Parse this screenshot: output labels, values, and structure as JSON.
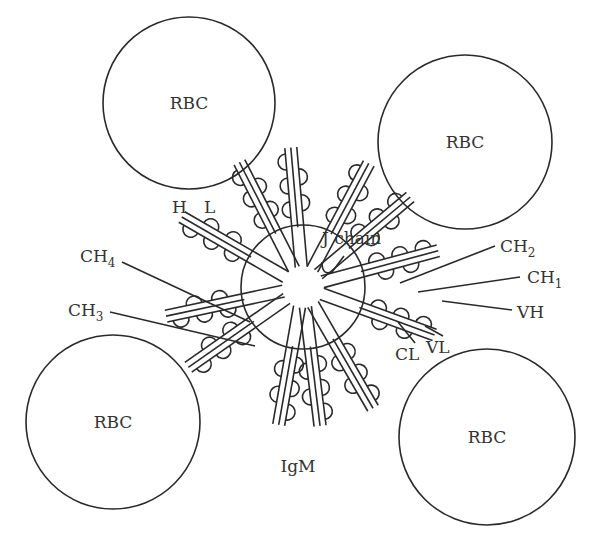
{
  "diagram": {
    "cells": [
      {
        "label": "RBC",
        "cx": 189,
        "cy": 103,
        "r": 86
      },
      {
        "label": "RBC",
        "cx": 465,
        "cy": 142,
        "r": 87
      },
      {
        "label": "RBC",
        "cx": 113,
        "cy": 422,
        "r": 87
      },
      {
        "label": "RBC",
        "cx": 487,
        "cy": 437,
        "r": 88
      }
    ],
    "center_molecule": {
      "label": "IgM",
      "cx": 303,
      "cy": 287,
      "r": 62
    },
    "labels": {
      "heavy_chain": "H",
      "light_chain": "L",
      "j_chain": "J chain",
      "ch4": "CH",
      "ch4_sub": "4",
      "ch3": "CH",
      "ch3_sub": "3",
      "ch2": "CH",
      "ch2_sub": "2",
      "ch1": "CH",
      "ch1_sub": "1",
      "vh": "VH",
      "cl": "CL",
      "vl": "VL",
      "igm": "IgM"
    },
    "colors": {
      "line": "#2a2a2a",
      "text": "#333333",
      "background": "#ffffff"
    }
  }
}
